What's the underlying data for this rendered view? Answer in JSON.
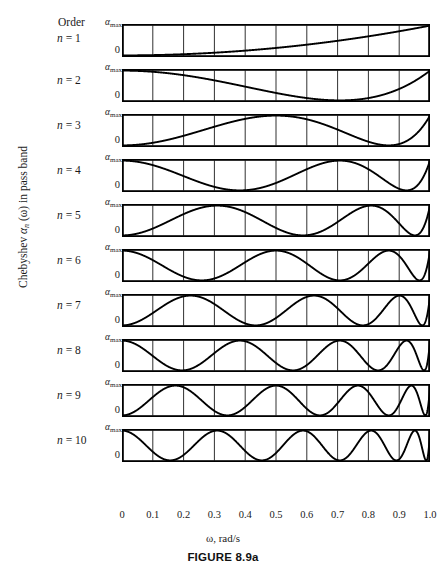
{
  "page_header": {
    "text": "",
    "visible": false
  },
  "axes": {
    "ylabel_prefix": "Chebyshev ",
    "ylabel_symbol": "α",
    "ylabel_sub": "n",
    "ylabel_suffix": " (ω) in pass band",
    "ylabel_full": "Chebyshev αn (ω) in pass band",
    "xlabel": "ω, rad/s",
    "y_top_label": "α",
    "y_top_sub": "max",
    "y_bottom_label": "0",
    "order_label": "Order"
  },
  "figure_caption": "FIGURE 8.9a",
  "chart_data": {
    "type": "line",
    "title": "FIGURE 8.9a",
    "subtitle": "Chebyshev αn(ω) in pass band",
    "xlabel": "ω, rad/s",
    "ylabel": "Chebyshev αn (ω) in pass band",
    "xlim": [
      0,
      1.0
    ],
    "ylim": [
      0,
      1.0
    ],
    "grid": true,
    "grid_axis": "x",
    "legend": "none",
    "xticks": [
      "0",
      "0.1",
      "0.2",
      "0.3",
      "0.4",
      "0.5",
      "0.6",
      "0.7",
      "0.8",
      "0.9",
      "1.0"
    ],
    "xtick_values": [
      0,
      0.1,
      0.2,
      0.3,
      0.4,
      0.5,
      0.6,
      0.7,
      0.8,
      0.9,
      1.0
    ],
    "yticks": [
      "0",
      "αmax"
    ],
    "ytick_values": [
      0,
      1.0
    ],
    "formula": "alpha_n(w) = alpha_max * Tn(w)^2 , Tn(w) = cos(n * arccos(w))",
    "series": [
      {
        "name": "n = 1",
        "order": 1,
        "label": "n = 1",
        "ripples": 1,
        "zeros_in_band": 1,
        "y_at_x0": 0.0,
        "y_at_x1": 1.0
      },
      {
        "name": "n = 2",
        "order": 2,
        "label": "n = 2",
        "ripples": 2,
        "zeros_in_band": 1,
        "y_at_x0": 1.0,
        "y_at_x1": 1.0
      },
      {
        "name": "n = 3",
        "order": 3,
        "label": "n = 3",
        "ripples": 3,
        "zeros_in_band": 2,
        "y_at_x0": 0.0,
        "y_at_x1": 1.0
      },
      {
        "name": "n = 4",
        "order": 4,
        "label": "n = 4",
        "ripples": 4,
        "zeros_in_band": 2,
        "y_at_x0": 1.0,
        "y_at_x1": 1.0
      },
      {
        "name": "n = 5",
        "order": 5,
        "label": "n = 5",
        "ripples": 5,
        "zeros_in_band": 3,
        "y_at_x0": 0.0,
        "y_at_x1": 1.0
      },
      {
        "name": "n = 6",
        "order": 6,
        "label": "n = 6",
        "ripples": 6,
        "zeros_in_band": 3,
        "y_at_x0": 1.0,
        "y_at_x1": 1.0
      },
      {
        "name": "n = 7",
        "order": 7,
        "label": "n = 7",
        "ripples": 7,
        "zeros_in_band": 4,
        "y_at_x0": 0.0,
        "y_at_x1": 1.0
      },
      {
        "name": "n = 8",
        "order": 8,
        "label": "n = 8",
        "ripples": 8,
        "zeros_in_band": 4,
        "y_at_x0": 1.0,
        "y_at_x1": 1.0
      },
      {
        "name": "n = 9",
        "order": 9,
        "label": "n = 9",
        "ripples": 9,
        "zeros_in_band": 5,
        "y_at_x0": 0.0,
        "y_at_x1": 1.0
      },
      {
        "name": "n = 10",
        "order": 10,
        "label": "n = 10",
        "ripples": 10,
        "zeros_in_band": 5,
        "y_at_x0": 1.0,
        "y_at_x1": 1.0
      }
    ]
  },
  "style": {
    "curve_color": "#000000",
    "frame_color": "#000000",
    "grid_color": "#1a1a1a",
    "background": "#ffffff"
  }
}
